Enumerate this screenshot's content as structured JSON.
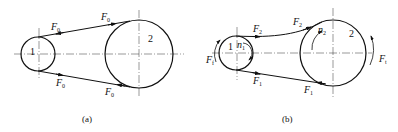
{
  "figure_a": {
    "caption": "(a)",
    "pulley_small_label": "1",
    "pulley_large_label": "2",
    "forces": [
      {
        "name": "F",
        "sub": "0",
        "position": "top-left"
      },
      {
        "name": "F",
        "sub": "0",
        "position": "top-right"
      },
      {
        "name": "F",
        "sub": "0",
        "position": "bottom-left"
      },
      {
        "name": "F",
        "sub": "0",
        "position": "bottom-right"
      }
    ]
  },
  "figure_b": {
    "caption": "(b)",
    "pulley_small_label": "1",
    "pulley_large_label": "2",
    "speed_small": {
      "name": "n",
      "sub": "1"
    },
    "speed_large": {
      "name": "n",
      "sub": "2"
    },
    "forces": [
      {
        "name": "F",
        "sub": "2",
        "position": "top-left"
      },
      {
        "name": "F",
        "sub": "2",
        "position": "top-right"
      },
      {
        "name": "F",
        "sub": "1",
        "position": "bottom-left"
      },
      {
        "name": "F",
        "sub": "1",
        "position": "bottom-right"
      },
      {
        "name": "F",
        "sub": "f",
        "position": "left-small-pulley"
      },
      {
        "name": "F",
        "sub": "t",
        "position": "right-large-pulley"
      }
    ]
  }
}
